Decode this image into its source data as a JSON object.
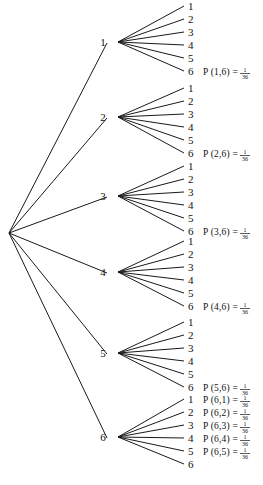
{
  "diagram": {
    "type": "probability-tree",
    "background_color": "#ffffff",
    "line_color": "#1a1a1a",
    "text_color": "#111111",
    "root": {
      "x": 9,
      "y": 233,
      "label": ""
    },
    "level1_x": 118,
    "level1_label_x": 103,
    "leaf_x": 188,
    "leaf_spacing": 13,
    "prob_x": 203,
    "branches": [
      {
        "label": "1",
        "node_y": 42,
        "leaf_top": 6,
        "leaves": [
          "1",
          "2",
          "3",
          "4",
          "5",
          "6"
        ],
        "probabilities": [
          {
            "leaf_index": 5,
            "text": "P (1,6) =",
            "numerator": "1",
            "denominator": "36"
          }
        ]
      },
      {
        "label": "2",
        "node_y": 117,
        "leaf_top": 88,
        "leaves": [
          "1",
          "2",
          "3",
          "4",
          "5",
          "6"
        ],
        "probabilities": [
          {
            "leaf_index": 5,
            "text": "P (2,6) =",
            "numerator": "1",
            "denominator": "36"
          }
        ]
      },
      {
        "label": "3",
        "node_y": 196,
        "leaf_top": 166,
        "leaves": [
          "1",
          "2",
          "3",
          "4",
          "5",
          "6"
        ],
        "probabilities": [
          {
            "leaf_index": 5,
            "text": "P (3,6) =",
            "numerator": "1",
            "denominator": "36"
          }
        ]
      },
      {
        "label": "4",
        "node_y": 272,
        "leaf_top": 241,
        "leaves": [
          "1",
          "2",
          "3",
          "4",
          "5",
          "6"
        ],
        "probabilities": [
          {
            "leaf_index": 5,
            "text": "P (4,6) =",
            "numerator": "1",
            "denominator": "36"
          }
        ]
      },
      {
        "label": "5",
        "node_y": 353,
        "leaf_top": 322,
        "leaves": [
          "1",
          "2",
          "3",
          "4",
          "5",
          "6"
        ],
        "probabilities": [
          {
            "leaf_index": 5,
            "text": "P (5,6) =",
            "numerator": "1",
            "denominator": "36"
          }
        ]
      },
      {
        "label": "6",
        "node_y": 437,
        "leaf_top": 399,
        "leaves": [
          "1",
          "2",
          "3",
          "4",
          "5",
          "6"
        ],
        "probabilities": [
          {
            "leaf_index": 0,
            "text": "P (6,1) =",
            "numerator": "1",
            "denominator": "36"
          },
          {
            "leaf_index": 1,
            "text": "P (6,2) =",
            "numerator": "1",
            "denominator": "36"
          },
          {
            "leaf_index": 2,
            "text": "P (6,3) =",
            "numerator": "1",
            "denominator": "36"
          },
          {
            "leaf_index": 3,
            "text": "P (6,4) =",
            "numerator": "1",
            "denominator": "36"
          },
          {
            "leaf_index": 4,
            "text": "P (6,5) =",
            "numerator": "1",
            "denominator": "36"
          }
        ]
      }
    ]
  }
}
